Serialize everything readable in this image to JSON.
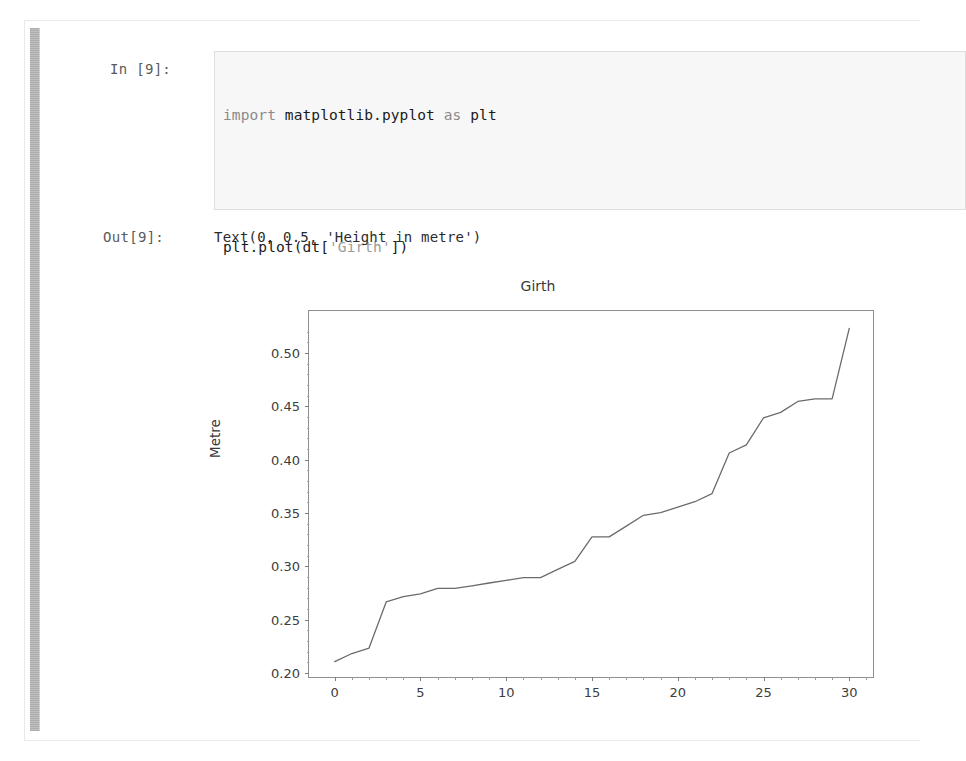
{
  "notebook": {
    "in_prompt": "In [9]:",
    "out_prompt": "Out[9]:",
    "out_text": "Text(0, 0.5, 'Height in metre')",
    "code": {
      "line1_kw": "import",
      "line1_rest": " matplotlib.pyplot ",
      "line1_kw2": "as",
      "line1_tail": " plt",
      "line2": "",
      "line3_a": "plt.plot(dt[",
      "line3_s": "'Girth'",
      "line3_b": "])",
      "line4_a": "plt.title(",
      "line4_s": "'Girth'",
      "line4_b": ")",
      "line5_a": "plt.ylabel(",
      "line5_s": "'Metre'",
      "line5_b": ")"
    }
  },
  "chart_data": {
    "type": "line",
    "title": "Girth",
    "xlabel": "",
    "ylabel": "Metre",
    "xlim": [
      -1.5,
      31.5
    ],
    "ylim": [
      0.1945,
      0.5395
    ],
    "xticks": [
      0,
      5,
      10,
      15,
      20,
      25,
      30
    ],
    "yticks": [
      0.2,
      0.25,
      0.3,
      0.35,
      0.4,
      0.45,
      0.5
    ],
    "ytick_labels": [
      "0.20",
      "0.25",
      "0.30",
      "0.35",
      "0.40",
      "0.45",
      "0.50"
    ],
    "xtick_labels": [
      "0",
      "5",
      "10",
      "15",
      "20",
      "25",
      "30"
    ],
    "grid": false,
    "legend": null,
    "line_color": "#6b6b6b",
    "line_width": 1.3,
    "series": [
      {
        "name": "Girth",
        "x": [
          0,
          1,
          2,
          3,
          4,
          5,
          6,
          7,
          8,
          9,
          10,
          11,
          12,
          13,
          14,
          15,
          16,
          17,
          18,
          19,
          20,
          21,
          22,
          23,
          24,
          25,
          26,
          27,
          28,
          29,
          30
        ],
        "values": [
          0.2108,
          0.2184,
          0.2235,
          0.2667,
          0.2718,
          0.2743,
          0.2794,
          0.2794,
          0.2819,
          0.2845,
          0.287,
          0.2896,
          0.2896,
          0.2972,
          0.3048,
          0.3277,
          0.3277,
          0.3378,
          0.348,
          0.3505,
          0.3556,
          0.3607,
          0.3683,
          0.4064,
          0.414,
          0.4394,
          0.4445,
          0.4547,
          0.4572,
          0.4572,
          0.5232
        ]
      }
    ]
  }
}
